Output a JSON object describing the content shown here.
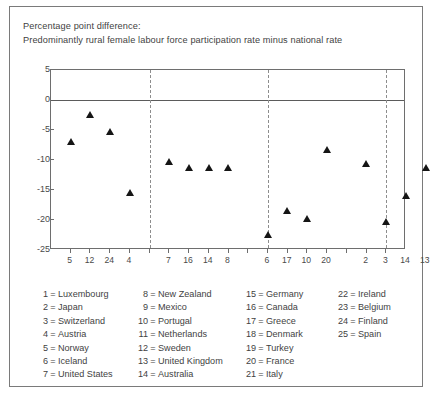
{
  "title": {
    "line1": "Percentage point difference:",
    "line2": "Predominantly rural female labour force participation rate minus national  rate"
  },
  "chart_data": {
    "type": "scatter",
    "title": "Predominantly rural female labour force participation rate minus national rate",
    "xlabel": "",
    "ylabel": "Percentage point difference",
    "ylim": [
      -25,
      5
    ],
    "yticks": [
      5,
      0,
      -5,
      -10,
      -15,
      -20,
      -25
    ],
    "ytick_labels": [
      "5",
      "0",
      "-5",
      "-10",
      "-15",
      "-20",
      "-25"
    ],
    "grid": false,
    "legend_position": "below-chart",
    "zero_line": 0,
    "group_dividers_after_index": [
      5,
      11,
      17
    ],
    "x_tick_count": 18,
    "categories": [
      "5",
      "12",
      "24",
      "4",
      "7",
      "16",
      "14",
      "8",
      "6",
      "17",
      "10",
      "20",
      "2",
      "3",
      "14",
      "13",
      "23"
    ],
    "points": [
      {
        "slot": 1,
        "code": "5",
        "country": "Norway",
        "value": -7.0
      },
      {
        "slot": 2,
        "code": "12",
        "country": "Sweden",
        "value": -2.4
      },
      {
        "slot": 3,
        "code": "24",
        "country": "Finland",
        "value": -5.2
      },
      {
        "slot": 4,
        "code": "4",
        "country": "Austria",
        "value": -15.5
      },
      {
        "slot": 6,
        "code": "7",
        "country": "United States",
        "value": -10.2
      },
      {
        "slot": 7,
        "code": "16",
        "country": "Canada",
        "value": -11.3
      },
      {
        "slot": 8,
        "code": "14",
        "country": "Australia",
        "value": -11.3
      },
      {
        "slot": 9,
        "code": "8",
        "country": "New Zealand",
        "value": -11.3
      },
      {
        "slot": 11,
        "code": "6",
        "country": "Iceland",
        "value": -22.4
      },
      {
        "slot": 12,
        "code": "17",
        "country": "Greece",
        "value": -18.5
      },
      {
        "slot": 13,
        "code": "10",
        "country": "Portugal",
        "value": -19.8
      },
      {
        "slot": 14,
        "code": "20",
        "country": "France",
        "value": -8.3
      },
      {
        "slot": 16,
        "code": "2",
        "country": "Japan",
        "value": -10.6
      },
      {
        "slot": 17,
        "code": "3",
        "country": "Switzerland",
        "value": -20.2
      },
      {
        "slot": 18,
        "code": "14",
        "country": "Australia",
        "value": -16.0
      },
      {
        "slot": 19,
        "code": "13",
        "country": "United Kingdom",
        "value": -11.3
      },
      {
        "slot": 20,
        "code": "23",
        "country": "Belgium",
        "value": -12.5
      }
    ],
    "xtick_labels": [
      {
        "slot": 1,
        "label": "5"
      },
      {
        "slot": 2,
        "label": "12"
      },
      {
        "slot": 3,
        "label": "24"
      },
      {
        "slot": 4,
        "label": "4"
      },
      {
        "slot": 6,
        "label": "7"
      },
      {
        "slot": 7,
        "label": "16"
      },
      {
        "slot": 8,
        "label": "14"
      },
      {
        "slot": 9,
        "label": "8"
      },
      {
        "slot": 11,
        "label": "6"
      },
      {
        "slot": 12,
        "label": "17"
      },
      {
        "slot": 13,
        "label": "10"
      },
      {
        "slot": 14,
        "label": "20"
      },
      {
        "slot": 16,
        "label": "2"
      },
      {
        "slot": 17,
        "label": "3"
      },
      {
        "slot": 18,
        "label": "14"
      },
      {
        "slot": 19,
        "label": "13"
      },
      {
        "slot": 20,
        "label": "23"
      }
    ]
  },
  "legend": {
    "columns": [
      [
        {
          "num": "1",
          "name": "Luxembourg"
        },
        {
          "num": "2",
          "name": "Japan"
        },
        {
          "num": "3",
          "name": "Switzerland"
        },
        {
          "num": "4",
          "name": "Austria"
        },
        {
          "num": "5",
          "name": "Norway"
        },
        {
          "num": "6",
          "name": "Iceland"
        },
        {
          "num": "7",
          "name": "United States"
        }
      ],
      [
        {
          "num": "8",
          "name": "New Zealand"
        },
        {
          "num": "9",
          "name": "Mexico"
        },
        {
          "num": "10",
          "name": "Portugal"
        },
        {
          "num": "11",
          "name": "Netherlands"
        },
        {
          "num": "12",
          "name": "Sweden"
        },
        {
          "num": "13",
          "name": "United Kingdom"
        },
        {
          "num": "14",
          "name": "Australia"
        }
      ],
      [
        {
          "num": "15",
          "name": "Germany"
        },
        {
          "num": "16",
          "name": "Canada"
        },
        {
          "num": "17",
          "name": "Greece"
        },
        {
          "num": "18",
          "name": "Denmark"
        },
        {
          "num": "19",
          "name": "Turkey"
        },
        {
          "num": "20",
          "name": "France"
        },
        {
          "num": "21",
          "name": "Italy"
        }
      ],
      [
        {
          "num": "22",
          "name": "Ireland"
        },
        {
          "num": "23",
          "name": "Belgium"
        },
        {
          "num": "24",
          "name": "Finland"
        },
        {
          "num": "25",
          "name": "Spain"
        }
      ]
    ]
  },
  "colors": {
    "marker": "#151515",
    "axis": "#6e6e6e",
    "zero_line": "#5b5b5b",
    "divider": "#8d8d8d",
    "text": "#3f3f3f",
    "frame": "#7a7a7a"
  }
}
